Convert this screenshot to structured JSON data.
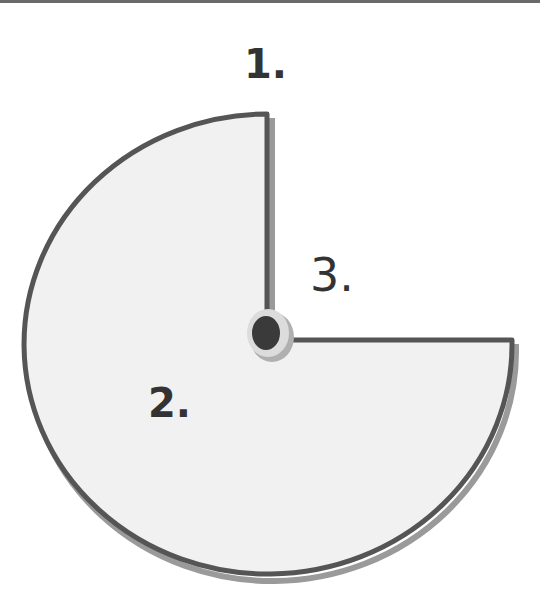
{
  "diagram": {
    "labels": [
      {
        "id": "1",
        "text": "1."
      },
      {
        "id": "2",
        "text": "2."
      },
      {
        "id": "3",
        "text": "3."
      }
    ],
    "shape": "three-quarter circle (pac-man) with center pivot",
    "colors": {
      "fill": "#f1f1f1",
      "stroke": "#555555",
      "shadow": "#8a8a8a",
      "pivot_outer": "#d8d8d8",
      "pivot_inner": "#3a3a3a"
    }
  }
}
